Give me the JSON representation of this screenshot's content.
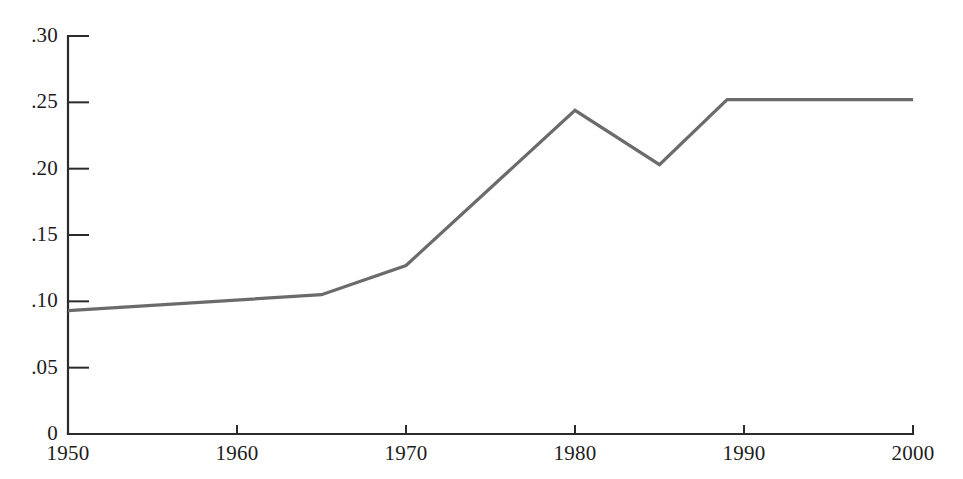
{
  "chart_data": {
    "type": "line",
    "title": "",
    "subtitle": "",
    "xlabel": "",
    "ylabel": "",
    "xlim": [
      1950,
      2000
    ],
    "ylim": [
      0,
      0.3
    ],
    "grid": false,
    "legend": null,
    "x_ticks": [
      1950,
      1960,
      1970,
      1980,
      1990,
      2000
    ],
    "x_tick_labels": [
      "1950",
      "1960",
      "1970",
      "1980",
      "1990",
      "2000"
    ],
    "y_ticks": [
      0,
      0.05,
      0.1,
      0.15,
      0.2,
      0.25,
      0.3
    ],
    "y_tick_labels": [
      "0",
      ".05",
      ".10",
      ".15",
      ".20",
      ".25",
      ".30"
    ],
    "series": [
      {
        "name": "series-1",
        "color": "#6b6b6b",
        "x": [
          1950,
          1965,
          1970,
          1980,
          1985,
          1989,
          2000
        ],
        "values": [
          0.093,
          0.105,
          0.127,
          0.244,
          0.203,
          0.252,
          0.252
        ]
      }
    ]
  },
  "axes": {
    "y_axis_name": "y-axis",
    "x_axis_name": "x-axis"
  }
}
